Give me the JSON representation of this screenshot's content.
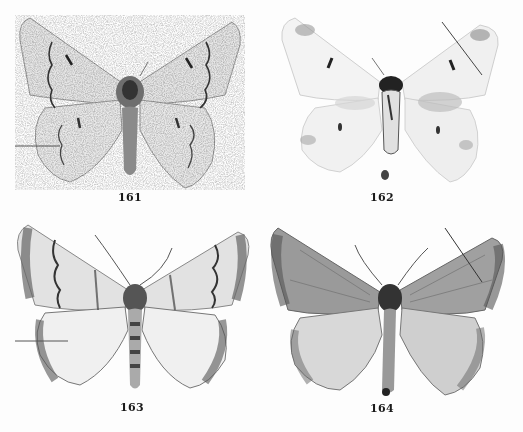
{
  "plate": {
    "background": "#fdfdfd",
    "figures": [
      {
        "number": "161",
        "label_x": 118,
        "label_y": 191,
        "tone": "light-speckled"
      },
      {
        "number": "162",
        "label_x": 370,
        "label_y": 191,
        "tone": "very-light-worn"
      },
      {
        "number": "163",
        "label_x": 120,
        "label_y": 401,
        "tone": "banded-grey"
      },
      {
        "number": "164",
        "label_x": 370,
        "label_y": 402,
        "tone": "dark-grey-suffused"
      }
    ]
  }
}
